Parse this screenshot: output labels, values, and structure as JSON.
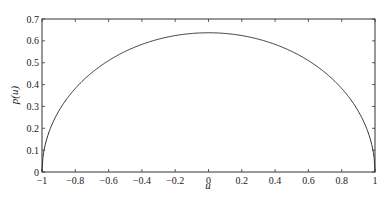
{
  "chart_data": {
    "type": "line",
    "title": "",
    "xlabel": "u",
    "ylabel": "p(u)",
    "xlim": [
      -1,
      1
    ],
    "ylim": [
      0,
      0.7
    ],
    "grid": false,
    "legend": null,
    "x_ticks": [
      "-1",
      "-0.8",
      "-0.6",
      "-0.4",
      "-0.2",
      "0",
      "0.2",
      "0.4",
      "0.6",
      "0.8",
      "1"
    ],
    "y_ticks": [
      "0",
      "0.1",
      "0.2",
      "0.3",
      "0.4",
      "0.5",
      "0.6",
      "0.7"
    ],
    "series": [
      {
        "name": "p(u)",
        "color": "#333333",
        "x": [
          -1,
          -0.99,
          -0.95,
          -0.9,
          -0.8,
          -0.7,
          -0.6,
          -0.5,
          -0.4,
          -0.3,
          -0.2,
          -0.1,
          0,
          0.1,
          0.2,
          0.3,
          0.4,
          0.5,
          0.6,
          0.7,
          0.8,
          0.9,
          0.95,
          0.99,
          1
        ],
        "values": [
          0,
          0.09,
          0.199,
          0.278,
          0.382,
          0.455,
          0.509,
          0.551,
          0.583,
          0.607,
          0.624,
          0.633,
          0.637,
          0.633,
          0.624,
          0.607,
          0.583,
          0.551,
          0.509,
          0.455,
          0.382,
          0.278,
          0.199,
          0.09,
          0
        ]
      }
    ]
  }
}
